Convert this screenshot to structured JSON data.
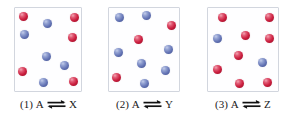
{
  "figure": {
    "name": "equilibrium-particulate-diagram",
    "background_color": "#ffffff",
    "box_border_color": "#d2d6de",
    "colors": {
      "red_sphere": "#cc2040",
      "blue_sphere": "#6878b8"
    },
    "legend": {
      "red_label": "A",
      "blue_label": "product"
    }
  },
  "panels": [
    {
      "id": "panel-1",
      "caption_number": "(1)",
      "caption_reactant": "A",
      "caption_arrow": "equilibrium-double-harpoon",
      "caption_product": "X",
      "caption_full": "(1) A ⇌ X",
      "box": {
        "left": 14,
        "top": 7,
        "width": 68,
        "height": 85
      },
      "counts": {
        "red": 5,
        "blue": 5,
        "total": 10
      },
      "spheres": [
        {
          "color": "red",
          "x": 4,
          "y": 4
        },
        {
          "color": "blue",
          "x": 28,
          "y": 11
        },
        {
          "color": "red",
          "x": 55,
          "y": 5
        },
        {
          "color": "blue",
          "x": 5,
          "y": 22
        },
        {
          "color": "red",
          "x": 53,
          "y": 25
        },
        {
          "color": "blue",
          "x": 27,
          "y": 44
        },
        {
          "color": "blue",
          "x": 45,
          "y": 53
        },
        {
          "color": "red",
          "x": 3,
          "y": 59
        },
        {
          "color": "blue",
          "x": 24,
          "y": 70
        },
        {
          "color": "red",
          "x": 54,
          "y": 69
        }
      ]
    },
    {
      "id": "panel-2",
      "caption_number": "(2)",
      "caption_reactant": "A",
      "caption_arrow": "equilibrium-double-harpoon",
      "caption_product": "Y",
      "caption_full": "(2) A ⇌ Y",
      "box": {
        "left": 108,
        "top": 7,
        "width": 72,
        "height": 85
      },
      "counts": {
        "red": 3,
        "blue": 7,
        "total": 10
      },
      "spheres": [
        {
          "color": "blue",
          "x": 6,
          "y": 5
        },
        {
          "color": "blue",
          "x": 33,
          "y": 3
        },
        {
          "color": "red",
          "x": 58,
          "y": 13
        },
        {
          "color": "red",
          "x": 25,
          "y": 27
        },
        {
          "color": "blue",
          "x": 5,
          "y": 40
        },
        {
          "color": "blue",
          "x": 55,
          "y": 37
        },
        {
          "color": "blue",
          "x": 28,
          "y": 51
        },
        {
          "color": "blue",
          "x": 52,
          "y": 58
        },
        {
          "color": "red",
          "x": 3,
          "y": 65
        },
        {
          "color": "blue",
          "x": 31,
          "y": 71
        }
      ]
    },
    {
      "id": "panel-3",
      "caption_number": "(3)",
      "caption_reactant": "A",
      "caption_arrow": "equilibrium-double-harpoon",
      "caption_product": "Z",
      "caption_full": "(3) A ⇌ Z",
      "box": {
        "left": 207,
        "top": 7,
        "width": 72,
        "height": 85
      },
      "counts": {
        "red": 8,
        "blue": 2,
        "total": 10
      },
      "spheres": [
        {
          "color": "red",
          "x": 10,
          "y": 5
        },
        {
          "color": "red",
          "x": 57,
          "y": 5
        },
        {
          "color": "blue",
          "x": 5,
          "y": 26
        },
        {
          "color": "red",
          "x": 33,
          "y": 23
        },
        {
          "color": "red",
          "x": 57,
          "y": 26
        },
        {
          "color": "red",
          "x": 26,
          "y": 43
        },
        {
          "color": "blue",
          "x": 50,
          "y": 50
        },
        {
          "color": "red",
          "x": 5,
          "y": 57
        },
        {
          "color": "red",
          "x": 27,
          "y": 71
        },
        {
          "color": "red",
          "x": 55,
          "y": 70
        }
      ]
    }
  ]
}
